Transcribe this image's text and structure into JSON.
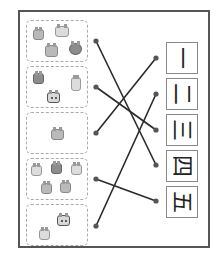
{
  "worksheet": {
    "task": "match animal count to Chinese numeral",
    "groups": [
      {
        "id": 1,
        "animal_count": 4
      },
      {
        "id": 2,
        "animal_count": 3
      },
      {
        "id": 3,
        "animal_count": 1
      },
      {
        "id": 4,
        "animal_count": 5
      },
      {
        "id": 5,
        "animal_count": 2
      }
    ],
    "numerals": [
      {
        "char": "一",
        "value": 1
      },
      {
        "char": "二",
        "value": 2
      },
      {
        "char": "三",
        "value": 3
      },
      {
        "char": "四",
        "value": 4
      },
      {
        "char": "五",
        "value": 5
      }
    ],
    "connections": [
      {
        "group": 1,
        "numeral": 4
      },
      {
        "group": 2,
        "numeral": 3
      },
      {
        "group": 3,
        "numeral": 1
      },
      {
        "group": 4,
        "numeral": 5
      },
      {
        "group": 5,
        "numeral": 2
      }
    ],
    "colors": {
      "line": "#2a2a2a",
      "dot": "#555555",
      "frame": "#555555"
    }
  }
}
